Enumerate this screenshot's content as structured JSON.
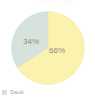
{
  "chart_data": {
    "type": "pie",
    "title": "",
    "subtitle": "",
    "xlabel": "",
    "ylabel": "",
    "grid": false,
    "legend_position": "bottom-left",
    "start_angle_deg": 0,
    "direction": "clockwise",
    "categories": [
      "66%",
      "34%"
    ],
    "values": [
      66,
      34
    ],
    "labels": [
      "66%",
      "34%"
    ],
    "colors": [
      "#faf2ad",
      "#d7e2dc"
    ],
    "series": [
      {
        "name": "share",
        "values": [
          66,
          34
        ]
      }
    ],
    "slices": [
      {
        "label": "66%",
        "value": 66,
        "color": "#faf2ad",
        "start_deg": 0,
        "end_deg": 237.6
      },
      {
        "label": "34%",
        "value": 34,
        "color": "#d7e2dc",
        "start_deg": 237.6,
        "end_deg": 360
      }
    ],
    "legend": [
      {
        "label": "Sauk",
        "color": "#d7e2dc",
        "swatch": "legend-swatch-square"
      }
    ]
  },
  "figure": {
    "name": "pie-chart",
    "background": "#ffffff",
    "label_color": "#8d8b84",
    "legend_text_color": "#a8a69f"
  }
}
